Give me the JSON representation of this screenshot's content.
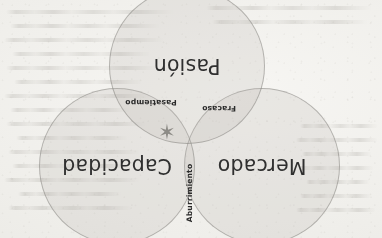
{
  "figure": {
    "kind": "venn-diagram",
    "orientation_note": "rotated-180",
    "background_color": "#efeeea",
    "circle_fill_color": "#b0aeaa",
    "circle_stroke_color": "#807e7a",
    "label_text_color": "#2f2f2f",
    "star_color": "#8d8b86"
  },
  "diagram": {
    "sets": [
      {
        "id": "mercado",
        "label": "Mercado",
        "cx": 120,
        "cy": 72,
        "r": 78
      },
      {
        "id": "capacidad",
        "label": "Capacidad",
        "cx": 265,
        "cy": 72,
        "r": 78
      },
      {
        "id": "pasion",
        "label": "Pasión",
        "cx": 195,
        "cy": 172,
        "r": 78
      }
    ],
    "intersections": [
      {
        "id": "aburrimiento",
        "label": "Aburrimiento",
        "x": 193,
        "y": 45,
        "orientation": "vertical"
      },
      {
        "id": "fracaso",
        "label": "Fracaso",
        "x": 163,
        "y": 130,
        "orientation": "horizontal"
      },
      {
        "id": "pasatiempo",
        "label": "Pasatiempo",
        "x": 231,
        "y": 136,
        "orientation": "horizontal"
      }
    ],
    "center_marker": {
      "id": "sweet-spot-star",
      "glyph": "✶",
      "x": 215,
      "y": 108
    }
  },
  "showthrough_lines": [
    {
      "x": 6,
      "y": 10,
      "w": 168
    },
    {
      "x": 10,
      "y": 24,
      "w": 150
    },
    {
      "x": 4,
      "y": 38,
      "w": 160
    },
    {
      "x": 12,
      "y": 52,
      "w": 138
    },
    {
      "x": 6,
      "y": 66,
      "w": 152
    },
    {
      "x": 14,
      "y": 80,
      "w": 128
    },
    {
      "x": 4,
      "y": 94,
      "w": 146
    },
    {
      "x": 10,
      "y": 108,
      "w": 120
    },
    {
      "x": 6,
      "y": 122,
      "w": 140
    },
    {
      "x": 16,
      "y": 136,
      "w": 112
    },
    {
      "x": 8,
      "y": 150,
      "w": 132
    },
    {
      "x": 12,
      "y": 164,
      "w": 118
    },
    {
      "x": 4,
      "y": 178,
      "w": 136
    },
    {
      "x": 18,
      "y": 192,
      "w": 104
    },
    {
      "x": 8,
      "y": 206,
      "w": 124
    },
    {
      "x": 300,
      "y": 124,
      "w": 78
    },
    {
      "x": 296,
      "y": 138,
      "w": 82
    },
    {
      "x": 302,
      "y": 152,
      "w": 70
    },
    {
      "x": 298,
      "y": 166,
      "w": 76
    },
    {
      "x": 306,
      "y": 180,
      "w": 64
    },
    {
      "x": 300,
      "y": 194,
      "w": 72
    },
    {
      "x": 296,
      "y": 208,
      "w": 80
    },
    {
      "x": 206,
      "y": 6,
      "w": 166
    },
    {
      "x": 212,
      "y": 20,
      "w": 156
    }
  ]
}
